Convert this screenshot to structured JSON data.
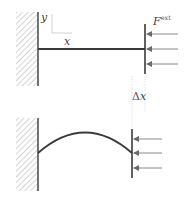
{
  "diagram": {
    "type": "mechanics-schematic",
    "colors": {
      "line": "#3a3a3a",
      "hatch": "#9a9a9a",
      "arrow": "#6a6a6a",
      "guide": "#cfcfcf",
      "background": "#ffffff"
    },
    "top_panel": {
      "axis_labels": {
        "y": "y",
        "x": "x"
      },
      "force_label": {
        "base": "F",
        "sup": "ext"
      },
      "arrow_count": 3
    },
    "bottom_panel": {
      "displacement_label": {
        "delta": "Δ",
        "var": "x"
      },
      "arrow_count": 3
    }
  }
}
